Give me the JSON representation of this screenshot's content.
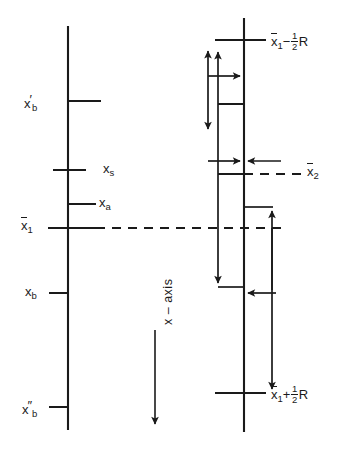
{
  "figure": {
    "background": "#ffffff",
    "ink_color": "#1a1a1a",
    "width": 357,
    "height": 451
  },
  "axis_label": {
    "text": "x – axis",
    "orientation": "vertical-rotated",
    "arrow_direction": "down"
  },
  "left_axis": {
    "name": "left-x-axis",
    "x": 68,
    "y_top": 26,
    "y_bottom": 430,
    "ticks": [
      {
        "id": "xb-prime",
        "label": "x'b",
        "y": 101,
        "side": "right"
      },
      {
        "id": "xs",
        "label": "xs",
        "y": 170,
        "side": "both"
      },
      {
        "id": "xa",
        "label": "xa",
        "y": 204,
        "side": "right"
      },
      {
        "id": "x1-bar",
        "label": "x̄1",
        "y": 228,
        "side": "both"
      },
      {
        "id": "xb",
        "label": "xb",
        "y": 293,
        "side": "right"
      },
      {
        "id": "xb-dprime",
        "label": "x''b",
        "y": 407,
        "side": "right"
      }
    ]
  },
  "right_axis": {
    "name": "right-x-axis",
    "x": 244,
    "y_top": 18,
    "y_bottom": 432,
    "ticks": [
      {
        "id": "x1-minus-half-r",
        "label": "x̄1 − ½R",
        "y": 40,
        "side": "both"
      },
      {
        "id": "upper-bound",
        "label": "",
        "y": 104,
        "side": "left"
      },
      {
        "id": "x2-bar",
        "label": "x̄2",
        "y": 174,
        "side": "both"
      },
      {
        "id": "x1-level",
        "label": "",
        "y": 228,
        "side": "left"
      },
      {
        "id": "mid-level",
        "label": "",
        "y": 287,
        "side": "left"
      },
      {
        "id": "x1-plus-half-r",
        "label": "x̄1 + ½R",
        "y": 393,
        "side": "both"
      }
    ]
  },
  "labels": {
    "xb_prime": {
      "base": "x",
      "prime": "'",
      "sub": "b",
      "bar": false
    },
    "xs": {
      "base": "x",
      "prime": "",
      "sub": "s",
      "bar": false
    },
    "xa": {
      "base": "x",
      "prime": "",
      "sub": "a",
      "bar": false
    },
    "x1_bar": {
      "base": "x",
      "prime": "",
      "sub": "1",
      "bar": true
    },
    "xb": {
      "base": "x",
      "prime": "",
      "sub": "b",
      "bar": false
    },
    "xb_dprime": {
      "base": "x",
      "prime": "''",
      "sub": "b",
      "bar": false
    },
    "x2_bar": {
      "base": "x",
      "prime": "",
      "sub": "2",
      "bar": true
    },
    "x1_minus_halfR": {
      "lead": "",
      "base": "x",
      "sub": "1",
      "op": "−",
      "num": "1",
      "den": "2",
      "tail": "R",
      "bar": true
    },
    "x1_plus_halfR": {
      "lead": "",
      "base": "x",
      "sub": "1",
      "op": "+",
      "num": "1",
      "den": "2",
      "tail": "R",
      "bar": true
    },
    "axis_text": "x – axis"
  },
  "dashed_lines": [
    {
      "id": "x1-dashed",
      "from_x": 68,
      "to_x": 280,
      "y": 228,
      "label": ""
    },
    {
      "id": "x2-dashed",
      "from_x": 218,
      "to_x": 300,
      "y": 174,
      "label": "x̄2"
    }
  ],
  "arrows": [
    {
      "id": "double-vertical-arrow",
      "x": 208,
      "y1": 46,
      "y2": 133,
      "heads": "both",
      "orient": "vertical"
    },
    {
      "id": "long-up-down-arrow",
      "x": 218,
      "y1": 46,
      "y2": 287,
      "heads": "both",
      "orient": "vertical"
    },
    {
      "id": "right-arrow-upper",
      "y": 76,
      "x1": 208,
      "x2": 244,
      "heads": "end",
      "orient": "horizontal"
    },
    {
      "id": "right-arrow-mid",
      "y": 161,
      "x1": 208,
      "x2": 244,
      "heads": "end",
      "orient": "horizontal"
    },
    {
      "id": "left-arrow-mid",
      "y": 161,
      "x1": 280,
      "x2": 244,
      "heads": "end",
      "orient": "horizontal"
    },
    {
      "id": "left-arrow-lower",
      "y": 293,
      "x1": 272,
      "x2": 244,
      "heads": "end",
      "orient": "horizontal"
    },
    {
      "id": "up-arrow-right",
      "x": 272,
      "y1": 393,
      "y2": 207,
      "heads": "end",
      "orient": "vertical"
    },
    {
      "id": "down-arrow-right",
      "x": 272,
      "y1": 207,
      "y2": 393,
      "heads": "end",
      "orient": "vertical"
    },
    {
      "id": "axis-direction-arrow",
      "x": 155,
      "y1": 330,
      "y2": 428,
      "heads": "end",
      "orient": "vertical"
    }
  ],
  "connectors": [
    {
      "id": "step-top",
      "x1": 244,
      "x2": 272,
      "y": 207
    },
    {
      "id": "step-bottom",
      "x1": 218,
      "x2": 244,
      "y": 287
    }
  ]
}
